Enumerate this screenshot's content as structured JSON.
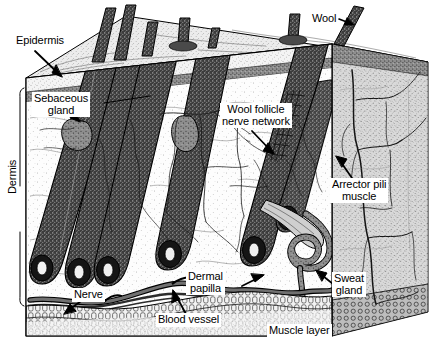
{
  "figure": {
    "type": "anatomical-diagram",
    "style": "black-and-white stippled line engraving, isometric cut-away block"
  },
  "labels": {
    "epidermis": "Epidermis",
    "sebaceous_gland_line1": "Sebaceous",
    "sebaceous_gland_line2": "gland",
    "dermis": "Dermis",
    "wool": "Wool",
    "wool_follicle_nerve_line1": "Wool follicle",
    "wool_follicle_nerve_line2": "nerve network",
    "arrector_pili_line1": "Arrector pili",
    "arrector_pili_line2": "muscle",
    "dermal_papilla_line1": "Dermal",
    "dermal_papilla_line2": "papilla",
    "sweat_gland_line1": "Sweat",
    "sweat_gland_line2": "gland",
    "nerve": "Nerve",
    "blood_vessel": "Blood vessel",
    "muscle_layer": "Muscle layer"
  },
  "colors": {
    "ink": "#000000",
    "paper": "#ffffff",
    "epidermis_fill": "#efefef",
    "dermis_fill": "#fbfbfb",
    "side_face_fill": "#c9c9c9",
    "top_face_fill": "#e6e6e6",
    "follicle_fill": "#3a3a3a",
    "muscle_fill": "#d8d8d8",
    "gland_fill": "#8a8a8a"
  },
  "structures": [
    {
      "name": "epidermis",
      "layer": "outer",
      "note": "thin stippled surface layer"
    },
    {
      "name": "dermis",
      "layer": "middle",
      "note": "thick layer containing follicles, glands, nerves, vessels"
    },
    {
      "name": "muscle-layer",
      "layer": "inner",
      "note": "basal striated band"
    },
    {
      "name": "wool-fibre",
      "count": 6,
      "note": "fibres emerging from surface"
    },
    {
      "name": "wool-follicle",
      "count": 6,
      "note": "dark stippled tubes angled down-left"
    },
    {
      "name": "sebaceous-gland",
      "count": 2
    },
    {
      "name": "sweat-gland",
      "count": 1,
      "note": "coiled tube at lower right"
    },
    {
      "name": "arrector-pili-muscle",
      "count": 1
    },
    {
      "name": "dermal-papilla",
      "count": 6,
      "note": "bulb at base of each follicle"
    },
    {
      "name": "nerve-network",
      "note": "branching fine lines around follicles"
    },
    {
      "name": "blood-vessel",
      "note": "vessel running along base of dermis"
    }
  ]
}
